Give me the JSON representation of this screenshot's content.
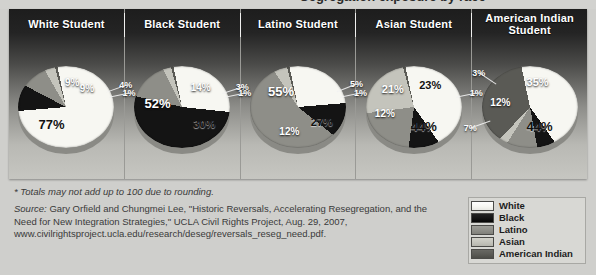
{
  "colors": {
    "white": "#f7f7f2",
    "black": "#141414",
    "latino": "#8e8e88",
    "asian": "#c4c4bc",
    "american_indian": "#5a5a55",
    "panel_dark": "#1d1d1d",
    "panel_light": "#c6c6c1",
    "page_background": "#cfcfcc",
    "legend_background": "#d8d8d4"
  },
  "ghost_title": "Segregation exposure by race",
  "legend": {
    "items": [
      {
        "label": "White",
        "color_key": "white"
      },
      {
        "label": "Black",
        "color_key": "black"
      },
      {
        "label": "Latino",
        "color_key": "latino"
      },
      {
        "label": "Asian",
        "color_key": "asian"
      },
      {
        "label": "American Indian",
        "color_key": "american_indian"
      }
    ]
  },
  "notes": {
    "footnote": "* Totals may not add up to 100 due to rounding.",
    "source_label": "Source:",
    "source_text": " Gary Orfield and Chungmei Lee, \"Historic Reversals, Accelerating Resegregation, and the Need for New Integration Strategies,\" UCLA Civil Rights Project, Aug. 29, 2007, www.civilrightsproject.ucla.edu/research/deseg/reversals_reseg_need.pdf."
  },
  "chart_data": {
    "type": "pie",
    "title": "",
    "categories": [
      "White",
      "Black",
      "Latino",
      "Asian",
      "American Indian"
    ],
    "legend_position": "bottom-right",
    "panels": [
      {
        "title": "White Student",
        "values": [
          77,
          9,
          9,
          4,
          1
        ],
        "labels": [
          "77%",
          "9%",
          "9%",
          "4%",
          "1%"
        ]
      },
      {
        "title": "Black Student",
        "values": [
          30,
          52,
          14,
          3,
          1
        ],
        "labels": [
          "30%",
          "52%",
          "14%",
          "3%",
          "1%"
        ]
      },
      {
        "title": "Latino Student",
        "values": [
          27,
          12,
          55,
          5,
          1
        ],
        "labels": [
          "27%",
          "12%",
          "55%",
          "5%",
          "1%"
        ]
      },
      {
        "title": "Asian Student",
        "values": [
          44,
          12,
          21,
          23,
          1
        ],
        "labels": [
          "44%",
          "12%",
          "21%",
          "23%",
          "1%"
        ]
      },
      {
        "title": "American Indian Student",
        "values": [
          44,
          7,
          12,
          3,
          35
        ],
        "labels": [
          "44%",
          "7%",
          "12%",
          "3%",
          "35%"
        ]
      }
    ]
  }
}
